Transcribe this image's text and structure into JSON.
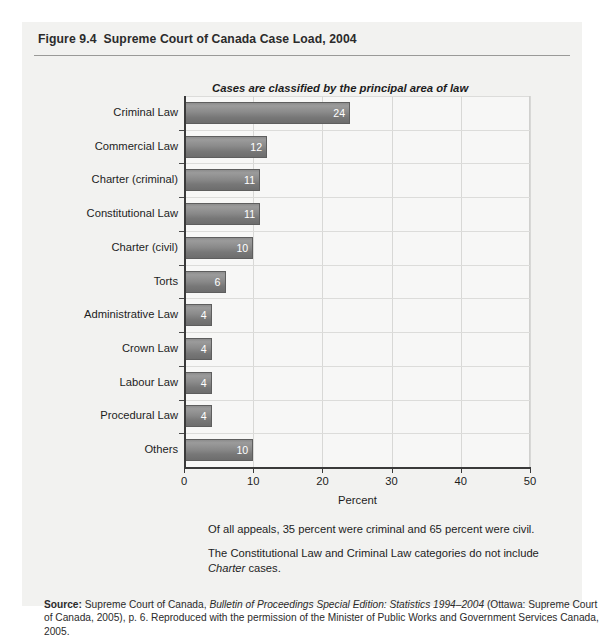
{
  "figure": {
    "number": "Figure 9.4",
    "title": "Supreme Court of Canada Case Load, 2004",
    "subtitle": "Cases are classified by the principal area of law"
  },
  "notes": [
    "Of all appeals, 35 percent were criminal and 65 percent were civil.",
    "The Constitutional Law and Criminal Law categories do not include Charter cases."
  ],
  "source": {
    "label": "Source:",
    "line1_pre": "Supreme Court of Canada, ",
    "line1_italic": "Bulletin of Proceedings Special Edition: Statistics 1994–2004",
    "line1_post": " (Ottawa:",
    "line2": "Supreme Court of Canada, 2005), p. 6. Reproduced with the permission of the Minister of Public",
    "line3": "Works and Government Services Canada, 2005."
  },
  "axis": {
    "x_title": "Percent",
    "x_ticks": [
      "0",
      "10",
      "20",
      "30",
      "40",
      "50"
    ]
  },
  "chart_data": {
    "type": "bar",
    "orientation": "horizontal",
    "title": "Supreme Court of Canada Case Load, 2004",
    "subtitle": "Cases are classified by the principal area of law",
    "categories": [
      "Criminal Law",
      "Commercial Law",
      "Charter (criminal)",
      "Constitutional Law",
      "Charter (civil)",
      "Torts",
      "Administrative Law",
      "Crown Law",
      "Labour Law",
      "Procedural Law",
      "Others"
    ],
    "values": [
      24,
      12,
      11,
      11,
      10,
      6,
      4,
      4,
      4,
      4,
      10
    ],
    "value_labels": [
      "24",
      "12",
      "11",
      "11",
      "10",
      "6",
      "4",
      "4",
      "4",
      "4",
      "10"
    ],
    "xlabel": "Percent",
    "ylabel": "",
    "xlim": [
      0,
      50
    ],
    "xticks": [
      0,
      10,
      20,
      30,
      40,
      50
    ],
    "grid": true,
    "legend": false,
    "bar_color": "#8a8a8a",
    "label_color": "#ffffff"
  }
}
